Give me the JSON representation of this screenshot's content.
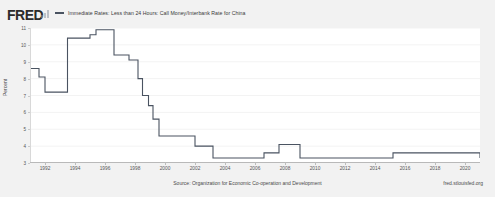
{
  "brand": {
    "logo_text": "FRED",
    "logo_mark_icon": "bar-chart-icon"
  },
  "legend": {
    "swatch_icon": "line-swatch-icon",
    "series_label": "Immediate Rates: Less than 24 Hours: Call Money/Interbank Rate for China",
    "series_color": "#4a5361"
  },
  "footer": {
    "source": "Source: Organization for Economic Co-operation and Development",
    "url": "fred.stlouisfed.org"
  },
  "chart_data": {
    "type": "line",
    "title": "Immediate Rates: Less than 24 Hours: Call Money/Interbank Rate for China",
    "xlabel": "",
    "ylabel": "Percent",
    "ylim": [
      3,
      11
    ],
    "xlim": [
      1991,
      2021
    ],
    "grid": true,
    "legend_position": "top",
    "line_color": "#4a5361",
    "step": true,
    "yticks": [
      3,
      4,
      5,
      6,
      7,
      8,
      9,
      10,
      11
    ],
    "ytick_labels": [
      "3",
      "4",
      "5",
      "6",
      "7",
      "8",
      "9",
      "10",
      "11"
    ],
    "xticks": [
      1992,
      1994,
      1996,
      1998,
      2000,
      2002,
      2004,
      2006,
      2008,
      2010,
      2012,
      2014,
      2016,
      2018,
      2020
    ],
    "xtick_labels": [
      "1992",
      "1994",
      "1996",
      "1998",
      "2000",
      "2002",
      "2004",
      "2006",
      "2008",
      "2010",
      "2012",
      "2014",
      "2016",
      "2018",
      "2020"
    ],
    "series": [
      {
        "name": "Immediate Rates: Less than 24 Hours: Call Money/Interbank Rate for China",
        "x": [
          1991.0,
          1991.6,
          1992.0,
          1993.3,
          1993.5,
          1994.6,
          1995.0,
          1995.4,
          1996.0,
          1996.6,
          1997.2,
          1997.6,
          1998.2,
          1998.5,
          1998.9,
          1999.2,
          1999.6,
          2000.0,
          2002.0,
          2003.2,
          2004.6,
          2006.6,
          2007.0,
          2007.6,
          2009.0,
          2015.2,
          2021.0
        ],
        "y": [
          8.6,
          8.1,
          7.2,
          7.2,
          10.4,
          10.4,
          10.6,
          10.9,
          10.9,
          9.4,
          9.4,
          9.1,
          8.0,
          7.0,
          6.4,
          5.6,
          4.6,
          4.6,
          4.0,
          3.3,
          3.3,
          3.6,
          3.6,
          4.1,
          3.3,
          3.6,
          3.3
        ],
        "color": "#4a5361"
      }
    ]
  }
}
